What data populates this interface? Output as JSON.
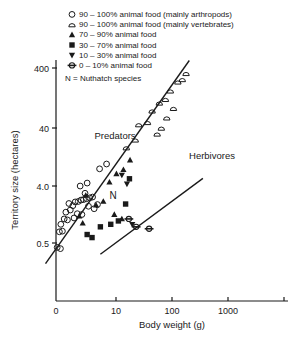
{
  "figure": {
    "axis_color": "#1a1a1a",
    "marker_color": "#1a1a1a",
    "background": "#ffffff"
  },
  "legend": {
    "items": [
      {
        "symbol": "open-circle",
        "label": "90 – 100% animal food (mainly arthropods)"
      },
      {
        "symbol": "open-dome",
        "label": "90 – 100% animal food (mainly vertebrates)"
      },
      {
        "symbol": "filled-triangle-up",
        "label": "70 –   90% animal food"
      },
      {
        "symbol": "filled-square",
        "label": "30 –   70% animal food"
      },
      {
        "symbol": "filled-triangle-down",
        "label": "10 –   30% animal food"
      },
      {
        "symbol": "barred-circle",
        "label": "0 –   10% animal food"
      }
    ],
    "note": "N = Nuthatch species"
  },
  "annotations": {
    "predators": "Predators",
    "herbivores": "Herbivores",
    "nuthatch": "N"
  },
  "chart_data": {
    "type": "scatter",
    "title": "",
    "xlabel": "Body weight (g)",
    "ylabel": "Territory size (hectares)",
    "xscale": "log",
    "yscale": "log",
    "xlim": [
      3,
      5000
    ],
    "ylim": [
      0.15,
      1200
    ],
    "xticks": [
      0,
      10,
      100,
      1000
    ],
    "xtick_labels": [
      "0",
      "10",
      "100",
      "1000"
    ],
    "yticks": [
      0.5,
      4.0,
      40,
      400
    ],
    "ytick_labels": [
      "0.5",
      "4.0",
      "40",
      "400"
    ],
    "grid": false,
    "legend_position": "top-right",
    "series": [
      {
        "name": "90 - 100% animal food (mainly arthropods)",
        "symbol": "open-circle",
        "points": [
          [
            10.5,
            0.42
          ],
          [
            12.0,
            0.4
          ],
          [
            11.5,
            0.78
          ],
          [
            13.0,
            0.8
          ],
          [
            12.2,
            1.05
          ],
          [
            14.0,
            1.3
          ],
          [
            16.0,
            1.25
          ],
          [
            15.0,
            1.7
          ],
          [
            18.0,
            1.85
          ],
          [
            20.0,
            2.2
          ],
          [
            17.0,
            2.4
          ],
          [
            22.0,
            2.55
          ],
          [
            25.0,
            2.6
          ],
          [
            28.0,
            2.75
          ],
          [
            31.0,
            2.8
          ],
          [
            35.0,
            2.9
          ],
          [
            40.0,
            3.0
          ],
          [
            45.0,
            3.1
          ],
          [
            33.0,
            3.6
          ],
          [
            38.0,
            2.15
          ],
          [
            29.0,
            1.55
          ],
          [
            24.0,
            1.6
          ],
          [
            21.0,
            1.35
          ],
          [
            27.0,
            4.8
          ],
          [
            36.0,
            5.4
          ],
          [
            60.0,
            9.5
          ],
          [
            80.0,
            11.5
          ],
          [
            48.0,
            1.95
          ],
          [
            55.0,
            2.3
          ]
        ]
      },
      {
        "name": "90 - 100% animal food (mainly vertebrates)",
        "symbol": "open-dome",
        "points": [
          [
            180,
            22
          ],
          [
            260,
            30
          ],
          [
            300,
            55
          ],
          [
            430,
            60
          ],
          [
            520,
            95
          ],
          [
            700,
            130
          ],
          [
            900,
            150
          ],
          [
            1100,
            210
          ],
          [
            1500,
            300
          ],
          [
            1800,
            330
          ],
          [
            950,
            72
          ],
          [
            760,
            48
          ],
          [
            640,
            38
          ],
          [
            1250,
            105
          ],
          [
            2100,
            420
          ]
        ]
      },
      {
        "name": "70 - 90% animal food",
        "symbol": "filled-triangle-up",
        "points": [
          [
            26,
            1.45
          ],
          [
            30,
            1.1
          ],
          [
            34,
            3.3
          ],
          [
            52,
            2.25
          ],
          [
            70,
            2.6
          ],
          [
            90,
            5.6
          ],
          [
            120,
            7.8
          ],
          [
            160,
            9.2
          ],
          [
            210,
            13.5
          ],
          [
            110,
            1.55
          ],
          [
            150,
            1.3
          ]
        ]
      },
      {
        "name": "30 - 70% animal food",
        "symbol": "filled-square",
        "points": [
          [
            44,
            0.62
          ],
          [
            62,
            0.95
          ],
          [
            95,
            1.05
          ],
          [
            130,
            1.2
          ],
          [
            175,
            2.35
          ],
          [
            205,
            6.4
          ],
          [
            36,
            0.7
          ]
        ]
      },
      {
        "name": "10 - 30% animal food",
        "symbol": "filled-triangle-down",
        "points": [
          [
            150,
            7.4
          ],
          [
            185,
            5.2
          ],
          [
            230,
            1.05
          ]
        ]
      },
      {
        "name": "0 - 10% animal food",
        "symbol": "barred-circle",
        "points": [
          [
            200,
            1.3
          ],
          [
            270,
            0.95
          ],
          [
            460,
            0.88
          ]
        ]
      }
    ],
    "trend_lines": [
      {
        "name": "Predators",
        "x": [
          6.5,
          2400
        ],
        "y": [
          0.22,
          700
        ]
      },
      {
        "name": "Herbivores",
        "x": [
          62,
          4200
        ],
        "y": [
          0.32,
          6.5
        ]
      }
    ]
  }
}
